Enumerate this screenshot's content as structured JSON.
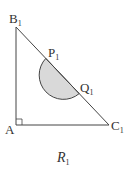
{
  "figure": {
    "vertices": {
      "B": {
        "label": "B",
        "sub": "1"
      },
      "A": {
        "label": "A",
        "sub": ""
      },
      "C": {
        "label": "C",
        "sub": "1"
      },
      "P": {
        "label": "P",
        "sub": "1"
      },
      "Q": {
        "label": "Q",
        "sub": "1"
      }
    },
    "caption": {
      "main": "R",
      "sub": "1"
    },
    "colors": {
      "stroke": "#444444",
      "fill": "#d9d9d9"
    }
  }
}
